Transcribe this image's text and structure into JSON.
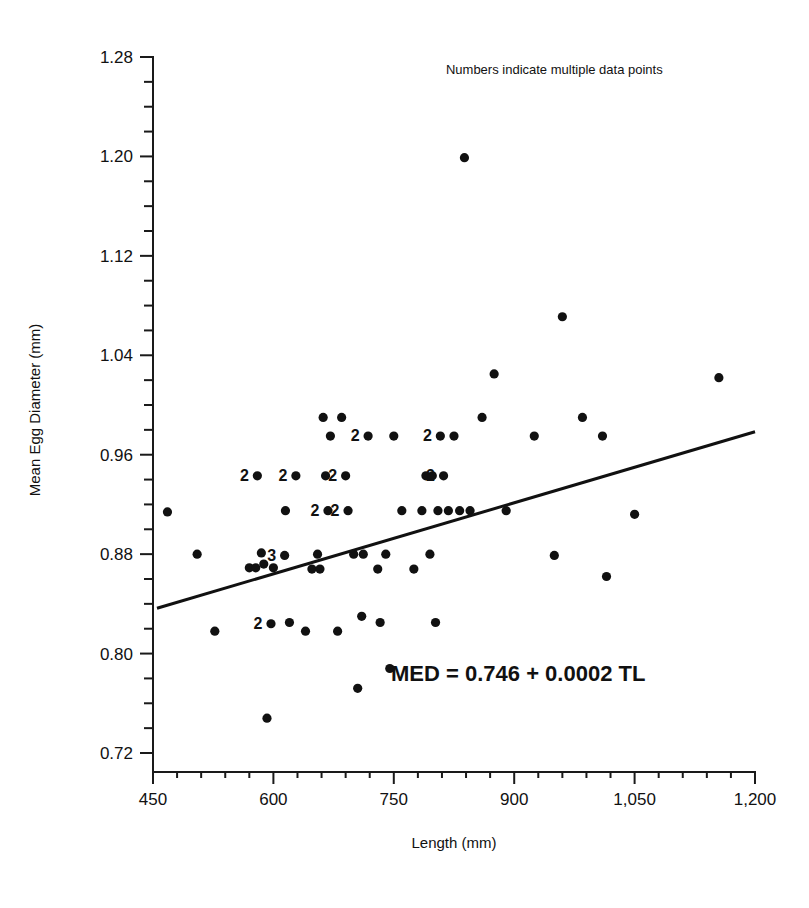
{
  "chart_data": {
    "type": "scatter",
    "title": "",
    "xlabel": "Length (mm)",
    "ylabel": "Mean Egg Diameter (mm)",
    "xlim": [
      450,
      1200
    ],
    "ylim": [
      0.72,
      1.28
    ],
    "grid": false,
    "legend": "none",
    "x_ticks": [
      450,
      600,
      750,
      900,
      1050,
      1200
    ],
    "x_tick_labels": [
      "450",
      "600",
      "750",
      "900",
      "1,050",
      "1,200"
    ],
    "x_minor_step": 30,
    "y_ticks": [
      0.72,
      0.8,
      0.88,
      0.96,
      1.04,
      1.12,
      1.2,
      1.28
    ],
    "y_tick_labels": [
      "0.72",
      "0.80",
      "0.88",
      "0.96",
      "1.04",
      "1.12",
      "1.20",
      "1.28"
    ],
    "y_minor_step": 0.02,
    "annotations": [
      {
        "name": "multiple-points-note",
        "text": "Numbers indicate multiple data points",
        "x": 950,
        "y": 1.266
      },
      {
        "name": "regression-equation",
        "text": "MED = 0.746 + 0.0002 TL",
        "x": 905,
        "y": 0.778
      }
    ],
    "regression_line": {
      "equation": "MED = 0.746 + 0.0002 TL",
      "intercept": 0.746,
      "slope": 0.0002,
      "x_start": 455,
      "y_start": 0.8365,
      "x_end": 1200,
      "y_end": 0.9785
    },
    "points": [
      {
        "x": 468,
        "y": 0.914,
        "n": 1
      },
      {
        "x": 505,
        "y": 0.88,
        "n": 1
      },
      {
        "x": 527,
        "y": 0.818,
        "n": 1
      },
      {
        "x": 570,
        "y": 0.869,
        "n": 1
      },
      {
        "x": 578,
        "y": 0.869,
        "n": 1
      },
      {
        "x": 580,
        "y": 0.943,
        "n": 2
      },
      {
        "x": 585,
        "y": 0.881,
        "n": 1
      },
      {
        "x": 588,
        "y": 0.872,
        "n": 1
      },
      {
        "x": 592,
        "y": 0.748,
        "n": 1
      },
      {
        "x": 597,
        "y": 0.824,
        "n": 2
      },
      {
        "x": 600,
        "y": 0.869,
        "n": 1
      },
      {
        "x": 614,
        "y": 0.879,
        "n": 3
      },
      {
        "x": 615,
        "y": 0.915,
        "n": 1
      },
      {
        "x": 620,
        "y": 0.825,
        "n": 1
      },
      {
        "x": 628,
        "y": 0.943,
        "n": 2
      },
      {
        "x": 640,
        "y": 0.818,
        "n": 1
      },
      {
        "x": 648,
        "y": 0.868,
        "n": 1
      },
      {
        "x": 655,
        "y": 0.88,
        "n": 1
      },
      {
        "x": 658,
        "y": 0.868,
        "n": 1
      },
      {
        "x": 662,
        "y": 0.99,
        "n": 1
      },
      {
        "x": 665,
        "y": 0.943,
        "n": 1
      },
      {
        "x": 668,
        "y": 0.915,
        "n": 2
      },
      {
        "x": 671,
        "y": 0.975,
        "n": 1
      },
      {
        "x": 680,
        "y": 0.818,
        "n": 1
      },
      {
        "x": 685,
        "y": 0.99,
        "n": 1
      },
      {
        "x": 690,
        "y": 0.943,
        "n": 2
      },
      {
        "x": 693,
        "y": 0.915,
        "n": 2
      },
      {
        "x": 700,
        "y": 0.88,
        "n": 1
      },
      {
        "x": 705,
        "y": 0.772,
        "n": 1
      },
      {
        "x": 710,
        "y": 0.83,
        "n": 1
      },
      {
        "x": 712,
        "y": 0.88,
        "n": 1
      },
      {
        "x": 718,
        "y": 0.975,
        "n": 2
      },
      {
        "x": 730,
        "y": 0.868,
        "n": 1
      },
      {
        "x": 733,
        "y": 0.825,
        "n": 1
      },
      {
        "x": 740,
        "y": 0.88,
        "n": 1
      },
      {
        "x": 745,
        "y": 0.788,
        "n": 1
      },
      {
        "x": 750,
        "y": 0.975,
        "n": 1
      },
      {
        "x": 760,
        "y": 0.915,
        "n": 1
      },
      {
        "x": 775,
        "y": 0.868,
        "n": 1
      },
      {
        "x": 785,
        "y": 0.915,
        "n": 1
      },
      {
        "x": 790,
        "y": 0.943,
        "n": 1
      },
      {
        "x": 795,
        "y": 0.88,
        "n": 1
      },
      {
        "x": 798,
        "y": 0.943,
        "n": 1
      },
      {
        "x": 802,
        "y": 0.825,
        "n": 1
      },
      {
        "x": 805,
        "y": 0.915,
        "n": 1
      },
      {
        "x": 808,
        "y": 0.975,
        "n": 2
      },
      {
        "x": 812,
        "y": 0.943,
        "n": 2
      },
      {
        "x": 818,
        "y": 0.915,
        "n": 1
      },
      {
        "x": 825,
        "y": 0.975,
        "n": 1
      },
      {
        "x": 832,
        "y": 0.915,
        "n": 1
      },
      {
        "x": 838,
        "y": 1.199,
        "n": 1
      },
      {
        "x": 845,
        "y": 0.915,
        "n": 1
      },
      {
        "x": 860,
        "y": 0.99,
        "n": 1
      },
      {
        "x": 875,
        "y": 1.025,
        "n": 1
      },
      {
        "x": 890,
        "y": 0.915,
        "n": 1
      },
      {
        "x": 925,
        "y": 0.975,
        "n": 1
      },
      {
        "x": 950,
        "y": 0.879,
        "n": 1
      },
      {
        "x": 960,
        "y": 1.071,
        "n": 1
      },
      {
        "x": 985,
        "y": 0.99,
        "n": 1
      },
      {
        "x": 1010,
        "y": 0.975,
        "n": 1
      },
      {
        "x": 1015,
        "y": 0.862,
        "n": 1
      },
      {
        "x": 1050,
        "y": 0.912,
        "n": 1
      },
      {
        "x": 1155,
        "y": 1.022,
        "n": 1
      }
    ]
  },
  "colors": {
    "ink": "#111111",
    "background": "#ffffff"
  }
}
